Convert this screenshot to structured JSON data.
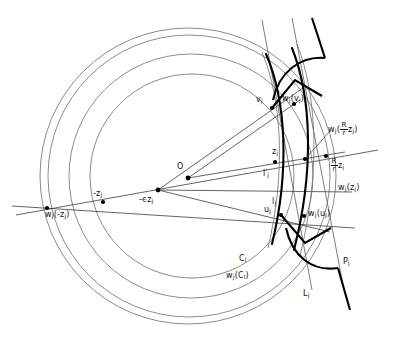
{
  "figure": {
    "type": "geometric-diagram",
    "stroke_colors": {
      "thin_curve": "#5a5a5a",
      "thick_curve": "#000000",
      "ray": "#3d3d3d",
      "point": "#000000"
    }
  },
  "labels": {
    "origin": "O",
    "minus_eps_zj": "-ϵz",
    "minus_eps_zj_sub": "j",
    "minus_zj": "-z",
    "minus_zj_sub": "j",
    "wj_minus_zj_pre": "w",
    "wj_minus_zj_sub": "j",
    "wj_minus_zj_arg": "(-z",
    "wj_minus_zj_arg_sub": "j",
    "wj_minus_zj_close": ")",
    "vj": "v",
    "vj_sub": "j",
    "uj": "u",
    "uj_sub": "j",
    "zj": "z",
    "zj_sub": "j",
    "lj": "l",
    "lj_sub": "j",
    "lj_prime": "l",
    "lj_prime_mark": "'",
    "lj_prime_sub": "j",
    "Cl": "C",
    "Cl_sub": "l",
    "wj_Cl_pre": "w",
    "wj_Cl_sub": "j",
    "wj_Cl_arg": "(C",
    "wj_Cl_arg_sub": "l",
    "wj_Cl_close": ")",
    "wj_vj_pre": "w",
    "wj_vj_sub": "j",
    "wj_vj_arg": "(v",
    "wj_vj_arg_sub": "j",
    "wj_vj_close": ")",
    "wj_uj_pre": "w",
    "wj_uj_sub": "j",
    "wj_uj_arg": "(u",
    "wj_uj_arg_sub": "j",
    "wj_uj_close": ")",
    "wj_zj_pre": "w",
    "wj_zj_sub": "j",
    "wj_zj_arg": "(z",
    "wj_zj_arg_sub": "j",
    "wj_zj_close": ")",
    "Rr_num": "R",
    "Rr_den": "r",
    "Rr_zj": "z",
    "Rr_zj_sub": "j",
    "wj_Rr_pre": "w",
    "wj_Rr_sub": "j",
    "wj_Rr_open": "(",
    "wj_Rr_zj": "z",
    "wj_Rr_zj_sub": "j",
    "wj_Rr_close": ")",
    "Lj": "L",
    "Lj_sub": "j",
    "Pj": "P",
    "Pj_sub": "j"
  },
  "points": [
    {
      "name": "wj(-zj)",
      "x": 47,
      "y": 208
    },
    {
      "name": "-zj",
      "x": 103,
      "y": 202
    },
    {
      "name": "-eps zj",
      "x": 158,
      "y": 190
    },
    {
      "name": "O",
      "x": 188,
      "y": 178
    },
    {
      "name": "vj",
      "x": 272,
      "y": 108
    },
    {
      "name": "wj(vj)",
      "x": 293,
      "y": 104
    },
    {
      "name": "zj",
      "x": 275,
      "y": 162
    },
    {
      "name": "Rr zj",
      "x": 325,
      "y": 157
    },
    {
      "name": "wj(Rr zj)",
      "x": 305,
      "y": 159
    },
    {
      "name": "uj",
      "x": 281,
      "y": 215
    },
    {
      "name": "wj(uj)",
      "x": 304,
      "y": 216
    }
  ]
}
